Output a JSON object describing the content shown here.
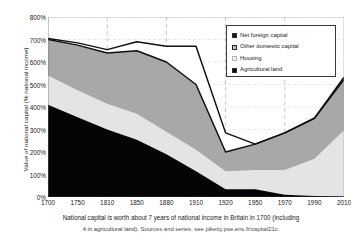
{
  "chart_data": {
    "type": "area",
    "stacked": true,
    "title": "",
    "xlabel": "",
    "ylabel": "Value of national capital (% national income)",
    "categories": [
      1700,
      1750,
      1810,
      1850,
      1880,
      1910,
      1920,
      1950,
      1970,
      1990,
      2010
    ],
    "tick_labels": [
      "1700",
      "1750",
      "1810",
      "1850",
      "1880",
      "1910",
      "1920",
      "1950",
      "1970",
      "1990",
      "2010"
    ],
    "ylim": [
      0,
      800
    ],
    "ytick_values": [
      0,
      100,
      200,
      300,
      400,
      500,
      600,
      700,
      800
    ],
    "ytick_labels": [
      "0%",
      "100%",
      "200%",
      "300%",
      "400%",
      "500%",
      "600%",
      "700%",
      "800%"
    ],
    "grid": "dashed-vertical",
    "legend_position": "top-right",
    "series": [
      {
        "name": "Agricultural land",
        "color": "#050505",
        "values": [
          410,
          355,
          300,
          255,
          190,
          115,
          35,
          35,
          10,
          5,
          2
        ]
      },
      {
        "name": "Housing",
        "color": "#e4e4e4",
        "values": [
          130,
          120,
          115,
          115,
          100,
          95,
          80,
          85,
          110,
          165,
          295
        ]
      },
      {
        "name": "Other domestic capital",
        "color": "#a8a8a8",
        "values": [
          160,
          200,
          225,
          280,
          310,
          290,
          85,
          115,
          165,
          180,
          225
        ]
      },
      {
        "name": "Net foreign capital",
        "color": "#ffffff",
        "values": [
          5,
          10,
          15,
          40,
          70,
          170,
          85,
          0,
          0,
          0,
          10
        ]
      }
    ],
    "totals": [
      705,
      685,
      655,
      690,
      670,
      670,
      285,
      235,
      285,
      350,
      532
    ],
    "domestic_totals": [
      700,
      675,
      640,
      650,
      600,
      500,
      200,
      235,
      285,
      350,
      522
    ],
    "annotations": []
  },
  "legend": {
    "items": [
      {
        "label": "Net foreign capital",
        "swatch": "black-square"
      },
      {
        "label": "Other domestic capital",
        "swatch": "gray-square"
      },
      {
        "label": "Housing",
        "swatch": "light-square"
      },
      {
        "label": "Agricultural land",
        "swatch": "black-square"
      }
    ]
  },
  "caption": {
    "line1": "National capital is worth about 7 years of national income in Britain in 1700 (including",
    "line2_a": "4 in agricultural land). ",
    "line2_b": "Sources and series: see piketty.pse.ens.fr/capital21c."
  },
  "colors": {
    "agricultural": "#050505",
    "housing": "#e4e4e4",
    "other_domestic": "#a8a8a8",
    "net_foreign": "#ffffff",
    "outline": "#101010",
    "grid": "#9a9a9a",
    "axis": "#2a2a2a"
  }
}
